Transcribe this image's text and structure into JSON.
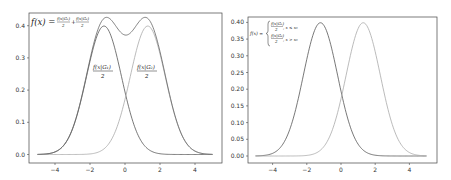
{
  "chart_data": [
    {
      "type": "line",
      "title": "",
      "xlabel": "",
      "ylabel": "",
      "xlim": [
        -5.5,
        5.5
      ],
      "ylim": [
        -0.02,
        0.44
      ],
      "xticks": [
        -4,
        -2,
        0,
        2,
        4
      ],
      "xtick_labels": [
        "−4",
        "−2",
        "0",
        "2",
        "4"
      ],
      "yticks": [
        0.0,
        0.1,
        0.2,
        0.3,
        0.4
      ],
      "ytick_labels": [
        "0.0",
        "0.1",
        "0.2",
        "0.3",
        "0.4"
      ],
      "grid": false,
      "series": [
        {
          "name": "f(x|G1)/2",
          "mean": -1.2,
          "sd": 1.0,
          "peak": 0.399,
          "color": "#555555"
        },
        {
          "name": "f(x|G2)/2",
          "mean": 1.3,
          "sd": 1.0,
          "peak": 0.399,
          "color": "#aaaaaa"
        },
        {
          "name": "f(x) = f(x|G1)/2 + f(x|G2)/2",
          "type": "sum",
          "peak": 0.425,
          "dip_at_0": 0.39,
          "color": "#666666"
        }
      ],
      "x_range": [
        -5,
        5
      ],
      "annotations": [
        {
          "text": "f(x) = f(x|G1)/2 + f(x|G2)/2",
          "position": "top-left"
        },
        {
          "text": "f(x|G1) / 2",
          "x": -1.8,
          "y": 0.27
        },
        {
          "text": "f(x|G2) / 2",
          "x": 1.0,
          "y": 0.27
        }
      ]
    },
    {
      "type": "line",
      "title": "",
      "xlabel": "",
      "ylabel": "",
      "xlim": [
        -5.5,
        5.5
      ],
      "ylim": [
        -0.02,
        0.41
      ],
      "xticks": [
        -4,
        -2,
        0,
        2,
        4
      ],
      "xtick_labels": [
        "−4",
        "−2",
        "0",
        "2",
        "4"
      ],
      "yticks": [
        0.0,
        0.05,
        0.1,
        0.15,
        0.2,
        0.25,
        0.3,
        0.35,
        0.4
      ],
      "ytick_labels": [
        "0.00",
        "0.05",
        "0.10",
        "0.15",
        "0.20",
        "0.25",
        "0.30",
        "0.35",
        "0.40"
      ],
      "grid": false,
      "series": [
        {
          "name": "f(x|G1)/2",
          "mean": -1.2,
          "sd": 1.0,
          "peak": 0.399,
          "color": "#555555"
        },
        {
          "name": "f(x|G2)/2",
          "mean": 1.3,
          "sd": 1.0,
          "peak": 0.399,
          "color": "#aaaaaa"
        }
      ],
      "x_range": [
        -5,
        5
      ],
      "annotations": [
        {
          "text": "f(x) = { f(x|G1)/2, x ≤ x0 ; f(x|G2)/2, x > x0 }",
          "position": "top-left"
        }
      ]
    }
  ],
  "labels": {
    "left_formula_lhs": "f(x) =",
    "left_frac1_num": "f(x|G₁)",
    "left_frac1_den": "2",
    "left_plus": "+",
    "left_frac2_num": "f(x|G₂)",
    "left_frac2_den": "2",
    "g1_num": "f(x|G₁)",
    "g1_den": "2",
    "g2_num": "f(x|G₂)",
    "g2_den": "2",
    "right_formula_lhs": "f(x) =",
    "right_case1_num": "f(x|G₁)",
    "right_case1_den": "2",
    "right_case1_cond": ", x ≤ x₀",
    "right_case2_num": "f(x|G₂)",
    "right_case2_den": "2",
    "right_case2_cond": ", x > x₀"
  }
}
